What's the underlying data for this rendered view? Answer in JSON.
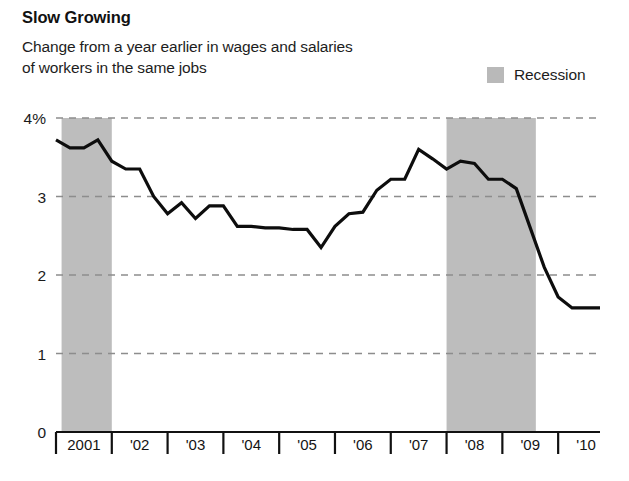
{
  "title": "Slow Growing",
  "subtitle": "Change from a year earlier in wages and salaries\nof workers in the same jobs",
  "legend": {
    "label": "Recession",
    "swatch_color": "#bdbdbd"
  },
  "chart_data": {
    "type": "line",
    "title": "Slow Growing",
    "subtitle": "Change from a year earlier in wages and salaries of workers in the same jobs",
    "xlabel": "",
    "ylabel": "",
    "ylim": [
      0,
      4
    ],
    "yticks": [
      0,
      1,
      2,
      3,
      4
    ],
    "ytick_labels": [
      "0",
      "1",
      "2",
      "3",
      "4%"
    ],
    "grid": "horizontal-dashed",
    "legend_position": "top-right",
    "xlim": [
      2001.0,
      2010.75
    ],
    "xtick_labels": [
      "2001",
      "'02",
      "'03",
      "'04",
      "'05",
      "'06",
      "'07",
      "'08",
      "'09",
      "'10"
    ],
    "xtick_values": [
      2001.5,
      2002.5,
      2003.5,
      2004.5,
      2005.5,
      2006.5,
      2007.5,
      2008.5,
      2009.5,
      2010.5
    ],
    "series": [
      {
        "name": "Change from a year earlier in wages and salaries",
        "units": "percent",
        "color": "#0d0d0d",
        "x": [
          2001.0,
          2001.25,
          2001.5,
          2001.75,
          2002.0,
          2002.25,
          2002.5,
          2002.75,
          2003.0,
          2003.25,
          2003.5,
          2003.75,
          2004.0,
          2004.25,
          2004.5,
          2004.75,
          2005.0,
          2005.25,
          2005.5,
          2005.75,
          2006.0,
          2006.25,
          2006.5,
          2006.75,
          2007.0,
          2007.25,
          2007.5,
          2007.75,
          2008.0,
          2008.25,
          2008.5,
          2008.75,
          2009.0,
          2009.25,
          2009.5,
          2009.75,
          2010.0,
          2010.25,
          2010.5,
          2010.75
        ],
        "values": [
          3.72,
          3.62,
          3.62,
          3.72,
          3.45,
          3.35,
          3.35,
          3.0,
          2.78,
          2.92,
          2.72,
          2.88,
          2.88,
          2.62,
          2.62,
          2.6,
          2.6,
          2.58,
          2.58,
          2.35,
          2.62,
          2.78,
          2.8,
          3.08,
          3.22,
          3.22,
          3.6,
          3.48,
          3.35,
          3.45,
          3.42,
          3.22,
          3.22,
          3.1,
          2.6,
          2.1,
          1.72,
          1.58,
          1.58,
          1.58
        ]
      }
    ],
    "annotations": [
      {
        "type": "recession-band",
        "label": "Recession",
        "color": "#bdbdbd",
        "start": 2001.1,
        "end": 2002.0
      },
      {
        "type": "recession-band",
        "label": "Recession",
        "color": "#bdbdbd",
        "start": 2008.0,
        "end": 2009.6
      }
    ]
  }
}
